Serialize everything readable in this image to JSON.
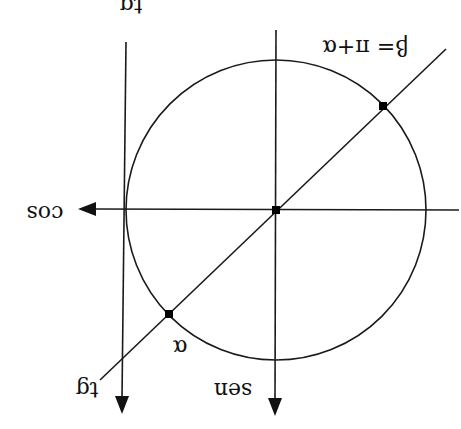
{
  "diagram": {
    "orientation": "rotated 180 degrees",
    "axes": {
      "sen": {
        "label": "sen"
      },
      "cos": {
        "label": "cos"
      },
      "tg": {
        "label": "tg"
      }
    },
    "points": {
      "alpha": {
        "label": "α"
      },
      "beta": {
        "label": "β= π+α"
      }
    },
    "colors": {
      "ink": "#111111",
      "background": "#ffffff"
    }
  }
}
